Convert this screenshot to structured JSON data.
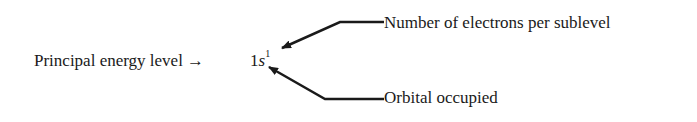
{
  "diagram": {
    "main_label": "Principal energy level →",
    "notation": {
      "level": "1",
      "orbital": "s",
      "electrons": "1"
    },
    "annotations": [
      {
        "label": "Number of electrons per sublevel",
        "points_to": "superscript"
      },
      {
        "label": "Orbital occupied",
        "points_to": "orbital letter"
      }
    ],
    "colors": {
      "ink": "#1a1a1a",
      "background": "#ffffff"
    }
  }
}
